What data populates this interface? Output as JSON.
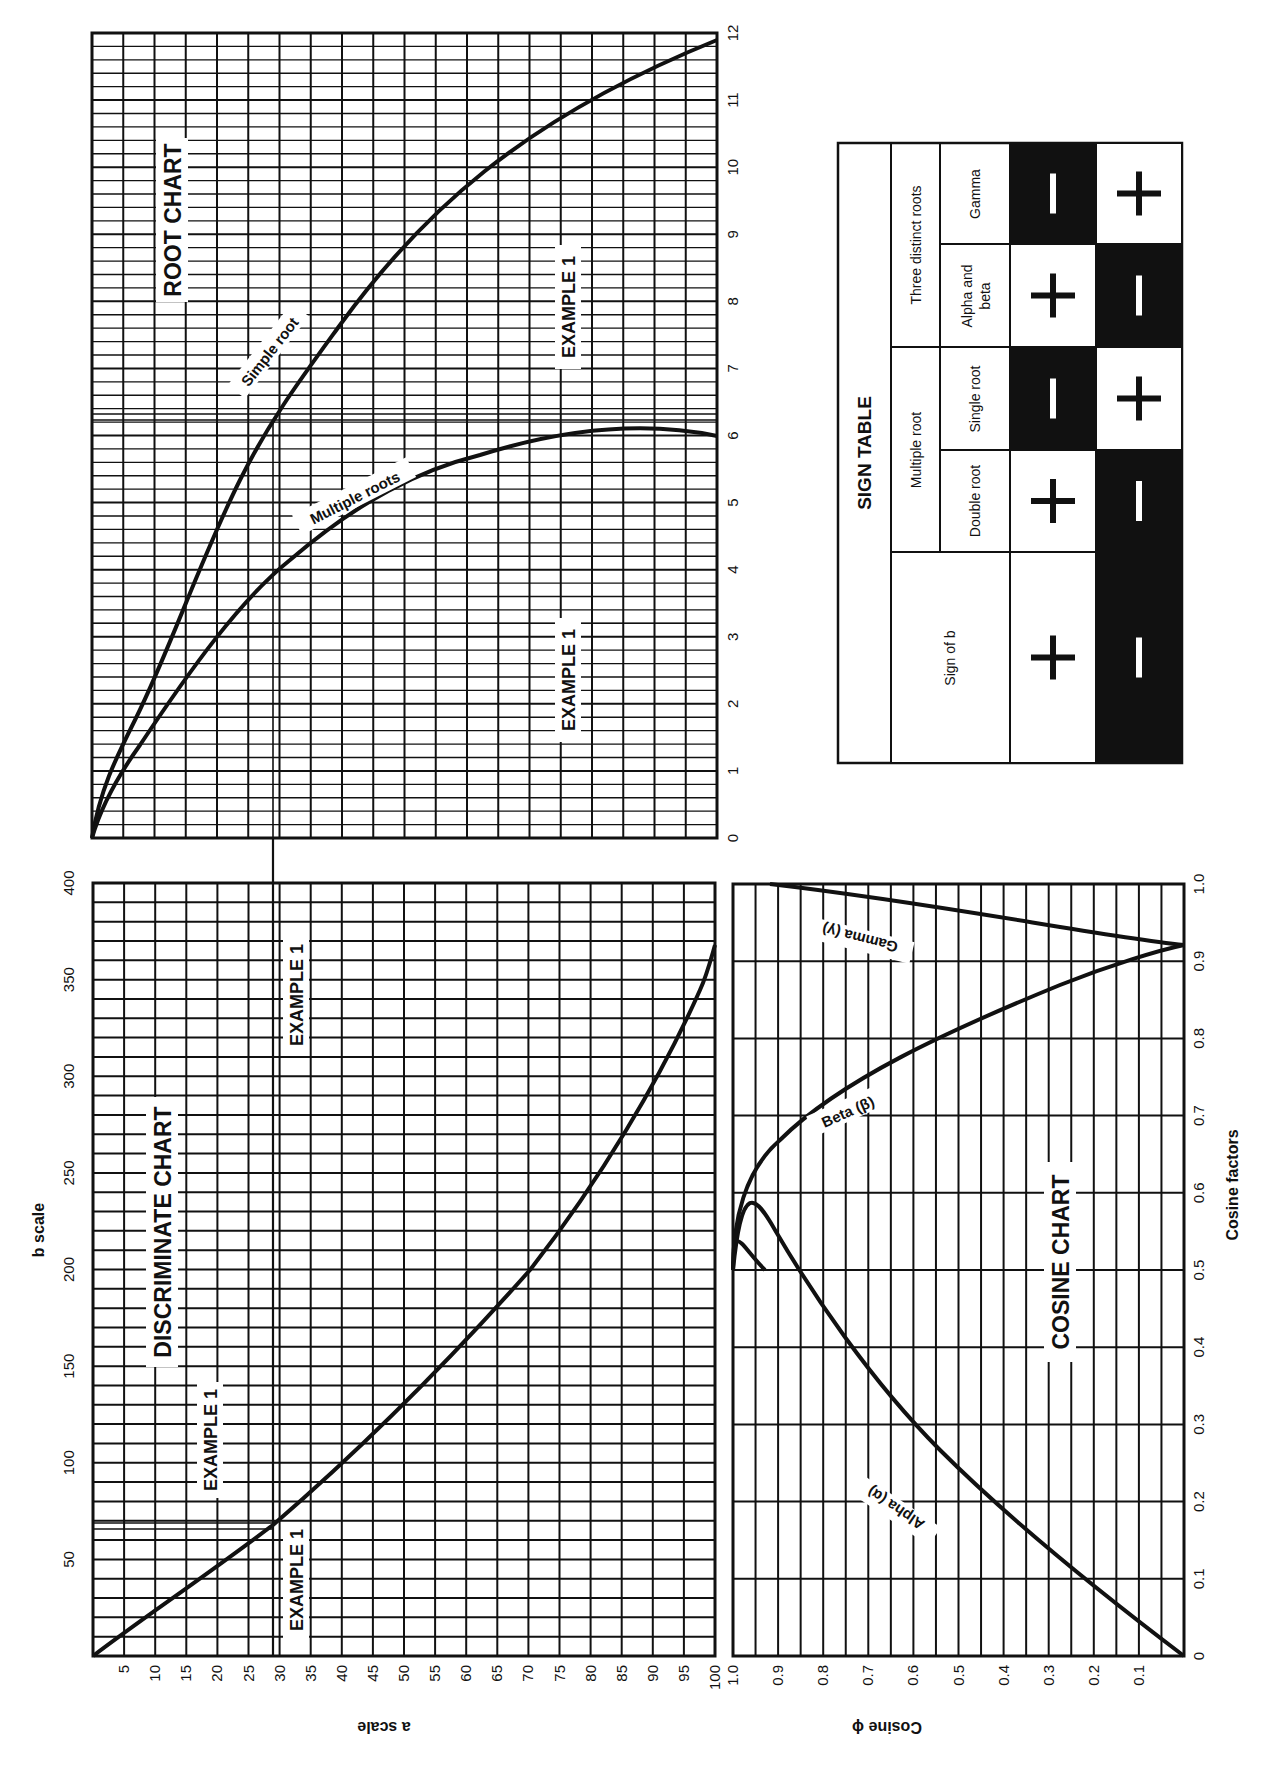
{
  "page": {
    "orientation": "rotated-90-clockwise",
    "ink_color": "#111111",
    "paper_color": "#ffffff"
  },
  "root_chart": {
    "title": "ROOT CHART",
    "axis_ticks": [
      "0",
      "1",
      "2",
      "3",
      "4",
      "5",
      "6",
      "7",
      "8",
      "9",
      "10",
      "11",
      "12"
    ],
    "curve_labels": {
      "simple": "Simple root",
      "multiple": "Multiple roots"
    },
    "example_labels": [
      "EXAMPLE 1",
      "EXAMPLE 1"
    ]
  },
  "discriminate_chart": {
    "title": "DISCRIMINATE CHART",
    "b_axis_label": "b scale",
    "a_axis_label": "a scale",
    "b_ticks": [
      "50",
      "100",
      "150",
      "200",
      "250",
      "300",
      "350",
      "400"
    ],
    "a_ticks": [
      "5",
      "10",
      "15",
      "20",
      "25",
      "30",
      "35",
      "40",
      "45",
      "50",
      "55",
      "60",
      "65",
      "70",
      "75",
      "80",
      "85",
      "90",
      "95",
      "100"
    ],
    "example_labels": [
      "EXAMPLE 1",
      "EXAMPLE 1",
      "EXAMPLE 1"
    ]
  },
  "cosine_chart": {
    "title": "COSINE CHART",
    "phi_axis_label": "Cosine ϕ",
    "factor_axis_label": "Cosine factors",
    "phi_ticks": [
      "1.0",
      "0.9",
      "0.8",
      "0.7",
      "0.6",
      "0.5",
      "0.4",
      "0.3",
      "0.2",
      "0.1"
    ],
    "factor_ticks": [
      "0",
      "0.1",
      "0.2",
      "0.3",
      "0.4",
      "0.5",
      "0.6",
      "0.7",
      "0.8",
      "0.9",
      "1.0"
    ],
    "curve_labels": {
      "alpha": "Alpha (α)",
      "beta": "Beta (β)",
      "gamma": "Gamma (γ)"
    }
  },
  "sign_table": {
    "title": "SIGN TABLE",
    "group_headers": {
      "sign_of_b": "Sign of b",
      "multiple_root": "Multiple root",
      "three_distinct": "Three distinct roots"
    },
    "sub_headers": {
      "double_root": "Double root",
      "single_root": "Single root",
      "alpha_beta_1": "Alpha and",
      "alpha_beta_2": "beta",
      "gamma": "Gamma"
    },
    "rows": [
      {
        "sign_of_b": "+",
        "double_root": "+",
        "single_root": "−",
        "alpha_beta": "+",
        "gamma": "−"
      },
      {
        "sign_of_b": "−",
        "double_root": "−",
        "single_root": "+",
        "alpha_beta": "−",
        "gamma": "+"
      }
    ]
  },
  "chart_data": [
    {
      "type": "line",
      "title": "ROOT CHART",
      "xlabel": "",
      "ylabel": "",
      "ylim": [
        0,
        12
      ],
      "grid": true,
      "x_shared_with": "discriminate a scale (0-100)",
      "series": [
        {
          "name": "Simple root",
          "x": [
            0,
            1,
            5,
            10,
            20,
            30,
            40,
            50,
            60,
            70,
            80,
            90,
            100
          ],
          "values": [
            0,
            1.0,
            1.7,
            2.2,
            3.0,
            3.7,
            4.3,
            5.0,
            5.9,
            7.0,
            8.4,
            10.0,
            11.9
          ]
        },
        {
          "name": "Multiple roots",
          "x": [
            0,
            1,
            5,
            10,
            20,
            30,
            40,
            50,
            60,
            70,
            80,
            90,
            100
          ],
          "values": [
            0,
            0.6,
            1.3,
            1.8,
            2.5,
            3.2,
            3.7,
            4.2,
            4.6,
            5.0,
            5.4,
            5.7,
            6.0
          ]
        }
      ],
      "annotations": [
        "EXAMPLE 1 at root ≈ 6.3 (simple)",
        "EXAMPLE 1 at root ≈ 3.2 (multiple)"
      ]
    },
    {
      "type": "line",
      "title": "DISCRIMINATE CHART",
      "xlabel": "a scale",
      "ylabel": "b scale",
      "xlim": [
        0,
        100
      ],
      "ylim": [
        0,
        400
      ],
      "grid": true,
      "series": [
        {
          "name": "discriminant boundary",
          "x": [
            0,
            5,
            10,
            15,
            20,
            25,
            30,
            35,
            40,
            45,
            50,
            55,
            60,
            65,
            70,
            75,
            80,
            85,
            90,
            95,
            100
          ],
          "values": [
            0,
            11,
            23,
            36,
            50,
            63,
            70,
            85,
            100,
            118,
            136,
            155,
            175,
            200,
            220,
            245,
            272,
            300,
            328,
            360,
            385
          ]
        }
      ],
      "annotations": [
        "EXAMPLE 1: a = 30",
        "EXAMPLE 1: b ≈ 68"
      ]
    },
    {
      "type": "line",
      "title": "COSINE CHART",
      "xlabel": "Cosine factors",
      "ylabel": "Cosine ϕ",
      "xlim": [
        0,
        1.0
      ],
      "ylim": [
        0,
        1.0
      ],
      "grid": true,
      "series": [
        {
          "name": "Alpha (α)",
          "x": [
            0,
            0.1,
            0.2,
            0.3,
            0.4,
            0.45,
            0.5
          ],
          "values": [
            0,
            0.25,
            0.48,
            0.68,
            0.85,
            0.93,
            1.0
          ]
        },
        {
          "name": "Beta (β)",
          "x": [
            0.5,
            0.6,
            0.7,
            0.8,
            0.866
          ],
          "values": [
            1.0,
            0.93,
            0.74,
            0.4,
            0.0
          ]
        },
        {
          "name": "Gamma (γ)",
          "x": [
            0.866,
            0.9,
            0.95,
            1.0
          ],
          "values": [
            0.0,
            0.27,
            0.63,
            1.0
          ]
        }
      ]
    },
    {
      "type": "table",
      "title": "SIGN TABLE",
      "columns": [
        "Sign of b",
        "Multiple root: Double root",
        "Multiple root: Single root",
        "Three distinct roots: Alpha and beta",
        "Three distinct roots: Gamma"
      ],
      "rows": [
        [
          "+",
          "+",
          "−",
          "+",
          "−"
        ],
        [
          "−",
          "−",
          "+",
          "−",
          "+"
        ]
      ]
    }
  ]
}
